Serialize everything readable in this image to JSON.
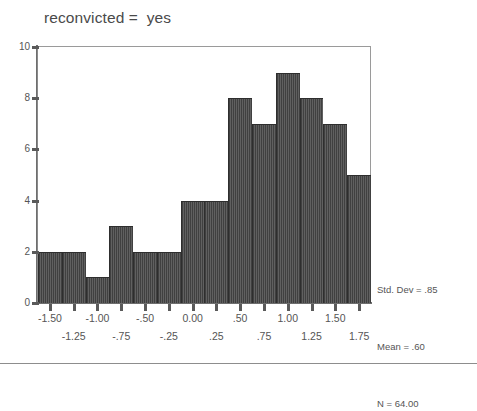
{
  "title": "reconvicted =  yes",
  "stats": {
    "std_dev": "Std. Dev = .85",
    "mean": "Mean = .60",
    "n": "N = 64.00"
  },
  "axes": {
    "y_ticks": [
      "0",
      "2",
      "4",
      "6",
      "8",
      "10"
    ],
    "x_ticks_row1": [
      "-1.50",
      "-1.00",
      "-.50",
      "0.00",
      ".50",
      "1.00",
      "1.50"
    ],
    "x_ticks_row2": [
      "-1.25",
      "-.75",
      "-.25",
      ".25",
      ".75",
      "1.25",
      "1.75"
    ]
  },
  "chart_data": {
    "type": "bar",
    "title": "reconvicted =  yes",
    "xlabel": "",
    "ylabel": "",
    "grid": false,
    "legend": "none",
    "ylim": [
      0,
      10
    ],
    "xlim": [
      -1.625,
      1.875
    ],
    "bin_width": 0.25,
    "categories": [
      "-1.50",
      "-1.25",
      "-1.00",
      "-.75",
      "-.50",
      "-.25",
      "0.00",
      ".25",
      ".50",
      ".75",
      "1.00",
      "1.25",
      "1.50",
      "1.75"
    ],
    "values": [
      2,
      2,
      1,
      3,
      2,
      2,
      4,
      4,
      8,
      7,
      9,
      8,
      7,
      5
    ],
    "y_ticks": [
      0,
      2,
      4,
      6,
      8,
      10
    ],
    "x_ticks": [
      -1.5,
      -1.25,
      -1.0,
      -0.75,
      -0.5,
      -0.25,
      0.0,
      0.25,
      0.5,
      0.75,
      1.0,
      1.25,
      1.5,
      1.75
    ],
    "annotations": [
      "Std. Dev = .85",
      "Mean = .60",
      "N = 64.00"
    ],
    "bar_color": "#4e4e4e"
  },
  "colors": {
    "bar": "#4e4e4e",
    "bar_edge": "#2e2e2e",
    "axis": "#6e6e6e",
    "text": "#555555",
    "title_text": "#4a4a4a",
    "rule": "#8d8d8d",
    "background": "#ffffff"
  }
}
